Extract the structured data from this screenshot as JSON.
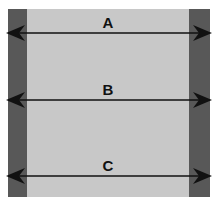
{
  "diagram": {
    "canvas": {
      "width": 217,
      "height": 206,
      "background": "#ffffff"
    },
    "colors": {
      "light_gray_fill": "#c8c8c8",
      "dark_gray_fill": "#585858",
      "arrow_color": "#111111",
      "background": "#ffffff"
    },
    "shape": {
      "outer": {
        "x": 8,
        "y": 9,
        "width": 202,
        "height": 188
      },
      "light_panel": {
        "x": 27,
        "y": 9,
        "width": 162,
        "height": 188
      },
      "left_bar": {
        "x": 8,
        "y": 9,
        "width": 19,
        "height": 188
      },
      "right_bar": {
        "x": 189,
        "y": 9,
        "width": 21,
        "height": 188
      }
    },
    "dimensions": [
      {
        "label": "A",
        "y": 33,
        "x_start": 11,
        "x_end": 211,
        "label_x": 108,
        "label_y": 28,
        "arrowheads": "both",
        "spans": "full outer width"
      },
      {
        "label": "B",
        "y": 100,
        "x_start": 11,
        "x_end": 211,
        "label_x": 108,
        "label_y": 95,
        "arrowheads": "both",
        "spans": "full outer width"
      },
      {
        "label": "C",
        "y": 176,
        "x_start": 11,
        "x_end": 211,
        "label_x": 108,
        "label_y": 171,
        "arrowheads": "both",
        "spans": "full outer width"
      }
    ]
  }
}
